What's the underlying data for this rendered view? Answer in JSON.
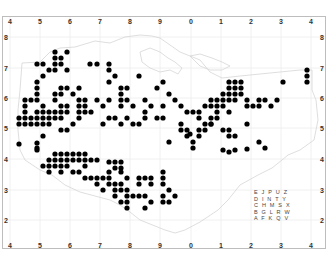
{
  "map": {
    "title": "",
    "type": "dot distribution map",
    "colors": {
      "dot": "#000000",
      "grid": "#e6e6e6",
      "coast": "#d9d9d9",
      "frame": "#bdbdbd",
      "label": "#333333"
    },
    "x_ticks": [
      {
        "label": "4",
        "x": 10
      },
      {
        "label": "5",
        "x": 40
      },
      {
        "label": "6",
        "x": 70
      },
      {
        "label": "7",
        "x": 100
      },
      {
        "label": "8",
        "x": 130
      },
      {
        "label": "9",
        "x": 160
      },
      {
        "label": "0",
        "x": 191
      },
      {
        "label": "1",
        "x": 221
      },
      {
        "label": "2",
        "x": 251
      },
      {
        "label": "3",
        "x": 281
      },
      {
        "label": "4",
        "x": 311
      }
    ],
    "y_ticks": [
      {
        "label": "8",
        "y": 37
      },
      {
        "label": "7",
        "y": 68
      },
      {
        "label": "6",
        "y": 98
      },
      {
        "label": "5",
        "y": 128
      },
      {
        "label": "4",
        "y": 159
      },
      {
        "label": "3",
        "y": 190
      },
      {
        "label": "2",
        "y": 220
      }
    ],
    "legend_rows": [
      "E J P U Z",
      "D I N T Y",
      "C H M S X",
      "B G L R W",
      "A F K Q V"
    ]
  }
}
